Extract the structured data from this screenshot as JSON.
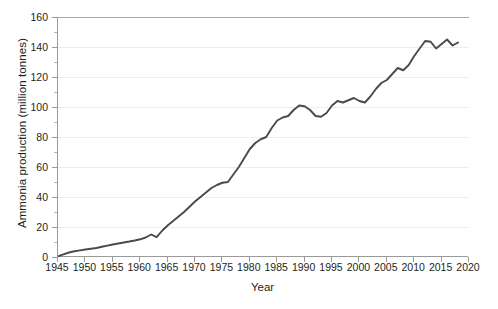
{
  "chart_data": {
    "type": "line",
    "title": "",
    "xlabel": "Year",
    "ylabel": "Ammonia production  (million tonnes)",
    "xlim": [
      1945,
      2020
    ],
    "ylim": [
      0,
      160
    ],
    "xticks": [
      1945,
      1950,
      1955,
      1960,
      1965,
      1970,
      1975,
      1980,
      1985,
      1990,
      1995,
      2000,
      2005,
      2010,
      2015,
      2020
    ],
    "yticks": [
      0,
      20,
      40,
      60,
      80,
      100,
      120,
      140,
      160
    ],
    "grid": "horizontal-major-faint",
    "legend": "none",
    "line_color": "#4a4a4a",
    "line_width": 1.9,
    "series": [
      {
        "name": "Ammonia production",
        "x": [
          1945,
          1946,
          1947,
          1948,
          1949,
          1950,
          1951,
          1952,
          1953,
          1954,
          1955,
          1956,
          1957,
          1958,
          1959,
          1960,
          1961,
          1962,
          1963,
          1964,
          1965,
          1966,
          1967,
          1968,
          1969,
          1970,
          1971,
          1972,
          1973,
          1974,
          1975,
          1976,
          1977,
          1978,
          1979,
          1980,
          1981,
          1982,
          1983,
          1984,
          1985,
          1986,
          1987,
          1988,
          1989,
          1990,
          1991,
          1992,
          1993,
          1994,
          1995,
          1996,
          1997,
          1998,
          1999,
          2000,
          2001,
          2002,
          2003,
          2004,
          2005,
          2006,
          2007,
          2008,
          2009,
          2010,
          2011,
          2012,
          2013,
          2014,
          2015,
          2016,
          2017,
          2018
        ],
        "y": [
          0.5,
          1.8,
          3.0,
          3.8,
          4.4,
          5.0,
          5.5,
          6.0,
          6.8,
          7.6,
          8.3,
          9.0,
          9.7,
          10.3,
          11.0,
          11.8,
          13.0,
          15.0,
          13.2,
          17.5,
          21.0,
          24.0,
          27.0,
          30.0,
          33.5,
          37.0,
          40.0,
          43.0,
          46.0,
          48.0,
          49.5,
          50.0,
          55.0,
          60.0,
          66.0,
          72.0,
          76.0,
          78.5,
          80.0,
          86.0,
          91.0,
          93.0,
          94.0,
          98.0,
          101.0,
          100.5,
          98.0,
          94.0,
          93.5,
          96.0,
          101.0,
          104.0,
          103.0,
          104.5,
          106.0,
          104.0,
          103.0,
          107.0,
          112.0,
          116.0,
          118.0,
          122.0,
          126.0,
          124.5,
          128.0,
          134.0,
          139.0,
          144.0,
          143.5,
          139.0,
          142.0,
          145.0,
          141.0,
          143.0
        ]
      }
    ]
  }
}
